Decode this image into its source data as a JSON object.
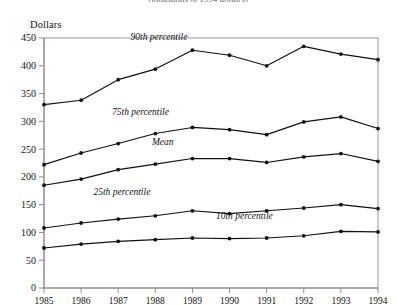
{
  "figure": {
    "subtitle": "(thousands of 1994 dollars)",
    "y_axis_title": "Dollars"
  },
  "chart_data": {
    "type": "line",
    "title": "",
    "subtitle": "(thousands of 1994 dollars)",
    "xlabel": "",
    "ylabel": "Dollars",
    "categories": [
      "1985",
      "1986",
      "1987",
      "1988",
      "1989",
      "1990",
      "1991",
      "1992",
      "1993",
      "1994"
    ],
    "x": [
      1985,
      1986,
      1987,
      1988,
      1989,
      1990,
      1991,
      1992,
      1993,
      1994
    ],
    "xlim": [
      1985,
      1994
    ],
    "ylim": [
      0,
      450
    ],
    "ytick_values": [
      0,
      50,
      100,
      150,
      200,
      250,
      300,
      350,
      400,
      450
    ],
    "ytick_labels": [
      "0",
      "50",
      "100",
      "150",
      "200",
      "250",
      "300",
      "350",
      "400",
      "450"
    ],
    "grid": false,
    "legend_position": "inline-annotations",
    "series": [
      {
        "name": "90th percentile",
        "label": "90th percentile",
        "label_x": 1988.1,
        "label_y": 447,
        "values": [
          330,
          338,
          375,
          394,
          428,
          419,
          400,
          435,
          421,
          411
        ]
      },
      {
        "name": "75th percentile",
        "label": "75th percentile",
        "label_x": 1987.6,
        "label_y": 312,
        "values": [
          222,
          243,
          260,
          278,
          289,
          285,
          276,
          299,
          308,
          287
        ]
      },
      {
        "name": "Mean",
        "label": "Mean",
        "label_x": 1988.2,
        "label_y": 258,
        "values": [
          185,
          196,
          213,
          223,
          233,
          233,
          226,
          236,
          242,
          228
        ]
      },
      {
        "name": "25th percentile",
        "label": "25th percentile",
        "label_x": 1987.1,
        "label_y": 168,
        "values": [
          108,
          117,
          124,
          130,
          139,
          134,
          139,
          144,
          150,
          143
        ]
      },
      {
        "name": "10th percentile",
        "label": "10th percentile",
        "label_x": 1990.4,
        "label_y": 124,
        "values": [
          72,
          79,
          84,
          87,
          90,
          89,
          90,
          94,
          102,
          101
        ]
      }
    ]
  }
}
